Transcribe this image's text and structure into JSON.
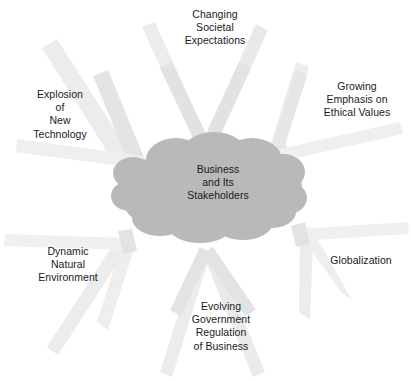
{
  "diagram": {
    "center": {
      "name": "business-and-its-stakeholders",
      "text": "Business\nand Its\nStakeholders",
      "shape": "cloud",
      "fill_color": "#b9b9b9"
    },
    "arrow_color": "#ececec",
    "arrow_color_dark": "#e0e0e0",
    "background_color": "#ffffff",
    "text_color": "#1a1a1a",
    "forces": [
      {
        "id": "changing-societal-expectations",
        "text": "Changing\nSocietal\nExpectations",
        "position": "top"
      },
      {
        "id": "growing-emphasis-on-ethical-values",
        "text": "Growing\nEmphasis on\nEthical Values",
        "position": "top-right"
      },
      {
        "id": "globalization",
        "text": "Globalization",
        "position": "bottom-right"
      },
      {
        "id": "evolving-government-regulation-of-business",
        "text": "Evolving\nGovernment\nRegulation\nof Business",
        "position": "bottom"
      },
      {
        "id": "dynamic-natural-environment",
        "text": "Dynamic\nNatural\nEnvironment",
        "position": "bottom-left"
      },
      {
        "id": "explosion-of-new-technology",
        "text": "Explosion\nof\nNew\nTechnology",
        "position": "top-left"
      }
    ]
  }
}
